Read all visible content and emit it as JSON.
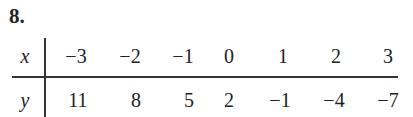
{
  "problem_number": "8.",
  "table": {
    "row_labels": [
      "x",
      "y"
    ],
    "x_values": [
      "−3",
      "−2",
      "−1",
      "0",
      "1",
      "2",
      "3"
    ],
    "y_values": [
      "11",
      "8",
      "5",
      "2",
      "−1",
      "−4",
      "−7"
    ]
  }
}
